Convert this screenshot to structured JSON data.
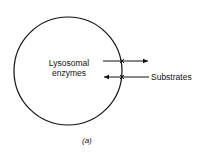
{
  "diagram": {
    "cell_label_line1": "Lysosomal",
    "cell_label_line2": "enzymes",
    "substrates_label": "Substrates",
    "caption": "(a)",
    "stroke_color": "#111111"
  }
}
